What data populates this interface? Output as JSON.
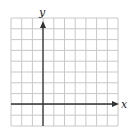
{
  "diagram": {
    "type": "coordinate-grid",
    "x_axis_label": "x",
    "y_axis_label": "y",
    "grid": {
      "columns": 10,
      "rows": 10,
      "y_axis_column_index": 3,
      "x_axis_row_index": 8
    },
    "colors": {
      "grid": "#c8c8c8",
      "axis": "#333333",
      "background": "#ffffff"
    }
  }
}
